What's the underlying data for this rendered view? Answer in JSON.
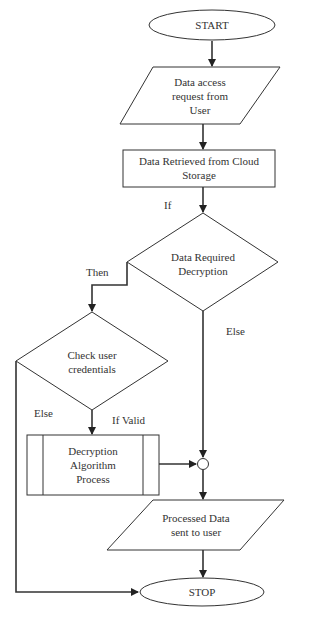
{
  "diagram": {
    "type": "flowchart",
    "nodes": {
      "start": {
        "shape": "terminator",
        "label": "START"
      },
      "request": {
        "shape": "input-output",
        "label": "Data access request from User",
        "lines": [
          "Data access",
          "request from",
          "User"
        ]
      },
      "retrieve": {
        "shape": "process",
        "label": "Data Retrieved from Cloud Storage",
        "lines": [
          "Data Retrieved from Cloud",
          "Storage"
        ]
      },
      "decision_decrypt": {
        "shape": "decision",
        "label": "Data Required Decryption",
        "lines": [
          "Data Required",
          "Decryption"
        ]
      },
      "check_credentials": {
        "shape": "decision",
        "label": "Check user credentials",
        "lines": [
          "Check user",
          "credentials"
        ]
      },
      "decrypt_process": {
        "shape": "predefined-process",
        "label": "Decryption Algorithm Process",
        "lines": [
          "Decryption",
          "Algorithm",
          "Process"
        ]
      },
      "junction": {
        "shape": "connector",
        "label": ""
      },
      "output": {
        "shape": "input-output",
        "label": "Processed Data sent to user",
        "lines": [
          "Processed Data",
          "sent to user"
        ]
      },
      "stop": {
        "shape": "terminator",
        "label": "STOP"
      }
    },
    "edges": [
      {
        "from": "start",
        "to": "request",
        "label": ""
      },
      {
        "from": "request",
        "to": "retrieve",
        "label": ""
      },
      {
        "from": "retrieve",
        "to": "decision_decrypt",
        "label": "If"
      },
      {
        "from": "decision_decrypt",
        "to": "check_credentials",
        "label": "Then"
      },
      {
        "from": "decision_decrypt",
        "to": "junction",
        "label": "Else"
      },
      {
        "from": "check_credentials",
        "to": "decrypt_process",
        "label": "If Valid"
      },
      {
        "from": "check_credentials",
        "to": "stop",
        "label": "Else"
      },
      {
        "from": "decrypt_process",
        "to": "junction",
        "label": ""
      },
      {
        "from": "junction",
        "to": "output",
        "label": ""
      },
      {
        "from": "output",
        "to": "stop",
        "label": ""
      }
    ],
    "edge_labels": {
      "if": "If",
      "then": "Then",
      "else_right": "Else",
      "else_left": "Else",
      "if_valid": "If Valid"
    },
    "colors": {
      "stroke": "#333333",
      "fill": "#ffffff",
      "text": "#333333"
    }
  }
}
